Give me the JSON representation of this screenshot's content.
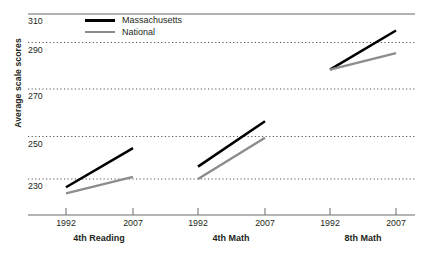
{
  "chart_data": {
    "type": "line",
    "title": "",
    "subtitle": "",
    "xlabel": "",
    "ylabel": "Average scale scores",
    "ylim": [
      220,
      315
    ],
    "yticks": [
      230,
      250,
      270,
      290,
      310
    ],
    "ytick_labels": [
      "230",
      "250",
      "270",
      "290",
      "310"
    ],
    "grid": true,
    "grid_style": "dotted",
    "legend_position": "top-center",
    "x": [
      "1992",
      "2007"
    ],
    "groups": [
      {
        "name": "4th Reading",
        "xtick_labels": [
          "1992",
          "2007"
        ],
        "series": [
          {
            "name": "Massachusetts",
            "values": [
              226,
              245
            ]
          },
          {
            "name": "National",
            "values": [
              223,
              231
            ]
          }
        ]
      },
      {
        "name": "4th Math",
        "xtick_labels": [
          "1992",
          "2007"
        ],
        "series": [
          {
            "name": "Massachusetts",
            "values": [
              236,
              258
            ]
          },
          {
            "name": "National",
            "values": [
              230,
              250
            ]
          }
        ]
      },
      {
        "name": "8th Math",
        "xtick_labels": [
          "1992",
          "2007"
        ],
        "series": [
          {
            "name": "Massachusetts",
            "values": [
              283,
              302
            ]
          },
          {
            "name": "National",
            "values": [
              283,
              291
            ]
          }
        ]
      }
    ],
    "series_colors": {
      "Massachusetts": "#000000",
      "National": "#8c8c8c"
    }
  },
  "legend": {
    "items": [
      {
        "label": "Massachusetts",
        "color": "#000000"
      },
      {
        "label": "National",
        "color": "#8c8c8c"
      }
    ]
  },
  "axis": {
    "y_title": "Average scale scores",
    "y_tick_310": "310",
    "y_tick_290": "290",
    "y_tick_270": "270",
    "y_tick_250": "250",
    "y_tick_230": "230",
    "x_g1_t1": "1992",
    "x_g1_t2": "2007",
    "x_g2_t1": "1992",
    "x_g2_t2": "2007",
    "x_g3_t1": "1992",
    "x_g3_t2": "2007",
    "group1": "4th Reading",
    "group2": "4th Math",
    "group3": "8th Math"
  }
}
